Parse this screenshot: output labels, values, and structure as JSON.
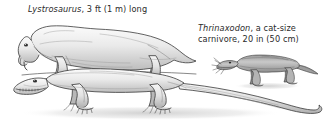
{
  "figure": {
    "background_color": "#ffffff",
    "ink_color": "#2a2a2a",
    "body_fill": "#e8e8e8",
    "shade_fill": "#b6b6b6",
    "shadow_color": "#d9d9d9"
  },
  "captions": {
    "lystrosaurus": {
      "species": "Lystrosaurus",
      "rest": ", 3 ft (1 m) long",
      "full": "Lystrosaurus, 3 ft (1 m) long"
    },
    "thrinaxodon": {
      "species": "Thrinaxodon",
      "line1_rest": ", a cat-size",
      "line2": "carnivore, 20 in (50 cm)",
      "full": "Thrinaxodon, a cat-size carnivore, 20 in (50 cm)"
    }
  },
  "specimens": [
    {
      "name": "Lystrosaurus",
      "description": "stocky tusked dicynodont, upper figure",
      "length_imperial": "3 ft",
      "length_metric": "1 m"
    },
    {
      "name": "large long-tailed reptile",
      "description": "long-bodied sprawling reptile, lower figure",
      "length_imperial": "",
      "length_metric": ""
    },
    {
      "name": "Thrinaxodon",
      "description": "cat-size carnivorous cynodont with whiskers, right figure",
      "length_imperial": "20 in",
      "length_metric": "50 cm"
    }
  ]
}
